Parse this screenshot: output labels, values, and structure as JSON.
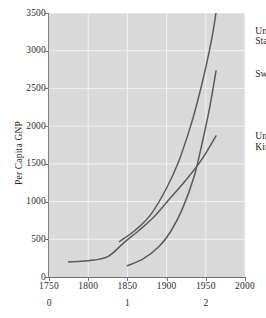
{
  "chart_data": {
    "type": "line",
    "title": "",
    "xlabel": "",
    "ylabel": "Per Capita GNP",
    "xlim": [
      1750,
      2000
    ],
    "ylim": [
      0,
      3500
    ],
    "grid": true,
    "legend_position": "inline-right",
    "background_color": "#d9d9d9",
    "line_color": "#5a5a5a",
    "x_ticks": [
      1750,
      1800,
      1850,
      1900,
      1950,
      2000
    ],
    "x_tick_labels": [
      "1750",
      "1800",
      "1850",
      "1900",
      "1950",
      "2000"
    ],
    "x_secondary_ticks": [
      1750,
      1850,
      1950
    ],
    "x_secondary_labels": [
      "0",
      "1",
      "2"
    ],
    "y_ticks": [
      0,
      500,
      1000,
      1500,
      2000,
      2500,
      3000,
      3500
    ],
    "y_tick_labels": [
      "0",
      "500",
      "1000",
      "1500",
      "2000",
      "2500",
      "3000",
      "3500"
    ],
    "series": [
      {
        "name": "United States",
        "label": "United\nStates",
        "label_x": 2013,
        "label_y": 3330,
        "x": [
          1840,
          1860,
          1880,
          1900,
          1915,
          1930,
          1940,
          1950,
          1958,
          1963
        ],
        "y": [
          470,
          620,
          830,
          1180,
          1520,
          1980,
          2350,
          2780,
          3180,
          3500
        ]
      },
      {
        "name": "Sweden",
        "label": "Sweden",
        "label_x": 2013,
        "label_y": 2760,
        "x": [
          1850,
          1870,
          1890,
          1905,
          1920,
          1935,
          1945,
          1955,
          1963
        ],
        "y": [
          150,
          240,
          400,
          600,
          900,
          1330,
          1760,
          2250,
          2730
        ]
      },
      {
        "name": "United Kingdom",
        "label": "United\nKingdom",
        "label_x": 2013,
        "label_y": 1930,
        "x": [
          1775,
          1800,
          1825,
          1845,
          1865,
          1885,
          1905,
          1925,
          1945,
          1963
        ],
        "y": [
          200,
          215,
          270,
          450,
          620,
          810,
          1050,
          1290,
          1560,
          1870
        ]
      }
    ]
  }
}
